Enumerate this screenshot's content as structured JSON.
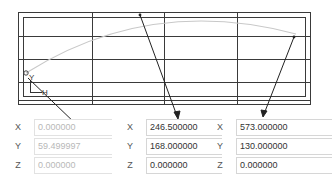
{
  "viewport": {
    "grid": {
      "outer_rect": {
        "x": 18,
        "y": 12,
        "w": 292,
        "h": 92
      },
      "inner_rect": {
        "x": 23,
        "y": 17,
        "w": 282,
        "h": 79
      },
      "vertical_lines": [
        92,
        164,
        237
      ],
      "horizontal_lines": [
        36,
        59,
        82,
        100
      ],
      "line_color": "#3a3a3a"
    },
    "curve": {
      "color": "#c8c8c8",
      "start": {
        "x": 26,
        "y": 73
      },
      "control": {
        "x": 150,
        "y": -5
      },
      "end": {
        "x": 296,
        "y": 34
      }
    },
    "points": [
      {
        "x": 26,
        "y": 73
      },
      {
        "x": 140,
        "y": 15
      },
      {
        "x": 294,
        "y": 37
      }
    ],
    "axis_gizmo": {
      "label_y": "Y",
      "label_x": "H"
    },
    "leaders": [
      {
        "from": {
          "x": 28,
          "y": 78
        },
        "to": {
          "x": 78,
          "y": 128
        }
      },
      {
        "from": {
          "x": 140,
          "y": 15
        },
        "to": {
          "x": 178,
          "y": 118
        }
      },
      {
        "from": {
          "x": 294,
          "y": 37
        },
        "to": {
          "x": 263,
          "y": 116
        }
      }
    ]
  },
  "points_panel": [
    {
      "id": "point-1",
      "disabled": true,
      "fields": [
        {
          "axis": "X",
          "value": "0.000000"
        },
        {
          "axis": "Y",
          "value": "59.499997"
        },
        {
          "axis": "Z",
          "value": "0.000000"
        }
      ]
    },
    {
      "id": "point-2",
      "disabled": false,
      "fields": [
        {
          "axis": "X",
          "value": "246.500000"
        },
        {
          "axis": "Y",
          "value": "168.000000"
        },
        {
          "axis": "Z",
          "value": "0.000000"
        }
      ]
    },
    {
      "id": "point-3",
      "disabled": false,
      "fields": [
        {
          "axis": "X",
          "value": "573.000000"
        },
        {
          "axis": "Y",
          "value": "130.000000"
        },
        {
          "axis": "Z",
          "value": "0.000000"
        }
      ]
    }
  ]
}
